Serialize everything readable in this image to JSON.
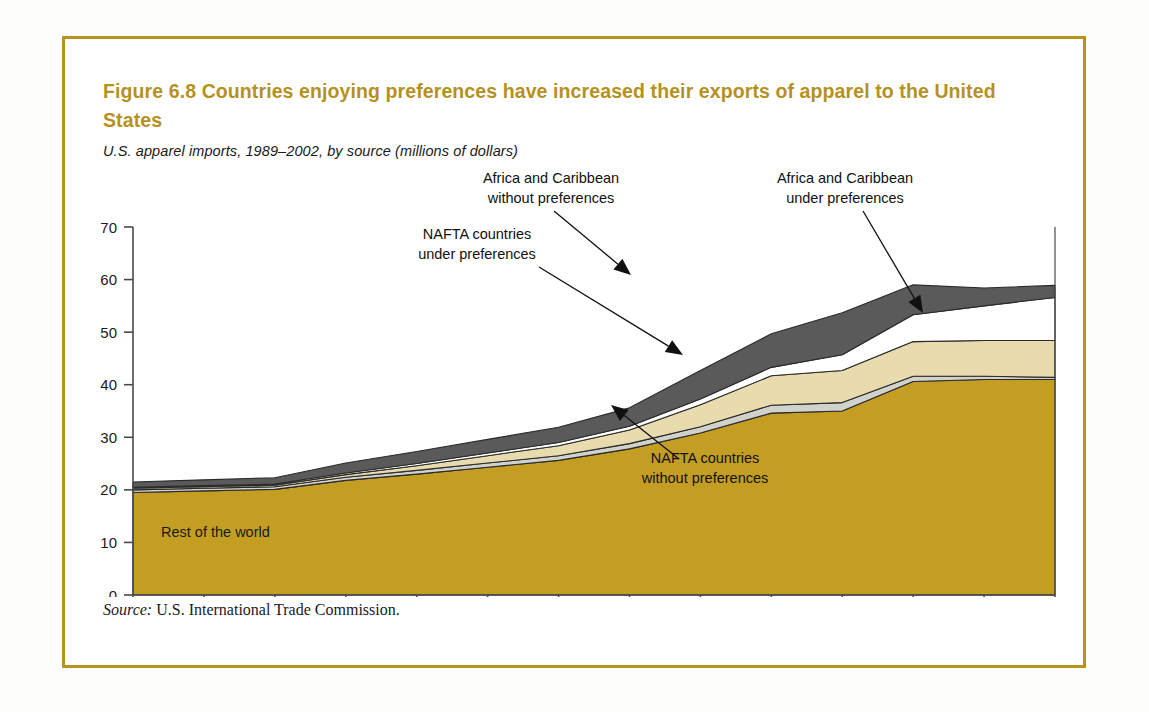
{
  "figure": {
    "title": "Figure 6.8  Countries enjoying preferences have increased their exports of apparel to the United States",
    "subtitle": "U.S. apparel imports, 1989–2002, by source (millions of dollars)",
    "source_label": "Source:",
    "source_text": " U.S. International Trade Commission.",
    "frame_color": "#b8941f",
    "title_color": "#b5911e"
  },
  "chart_data": {
    "type": "area",
    "stacked": true,
    "title": "Figure 6.8  Countries enjoying preferences have increased their exports of apparel to the United States",
    "subtitle": "U.S. apparel imports, 1989–2002, by source (millions of dollars)",
    "xlabel": "",
    "ylabel": "",
    "ylim": [
      0,
      70
    ],
    "ytick_step": 10,
    "yticks": [
      0,
      10,
      20,
      30,
      40,
      50,
      60,
      70
    ],
    "grid": false,
    "legend": "inline-annotations",
    "x": [
      1989,
      1990,
      1991,
      1992,
      1993,
      1994,
      1995,
      1996,
      1997,
      1998,
      1999,
      2000,
      2001,
      2002
    ],
    "categories": [
      "1989",
      "1990",
      "1991",
      "1992",
      "1993",
      "1994",
      "1995",
      "1996",
      "1997",
      "1998",
      "1999",
      "2000",
      "2001",
      "2002"
    ],
    "series": [
      {
        "name": "Rest of the world",
        "color": "#c39e23",
        "values": [
          19.5,
          19.8,
          20.1,
          21.8,
          23.0,
          24.3,
          25.6,
          27.8,
          30.8,
          34.6,
          35.0,
          40.6,
          41.0,
          41.0
        ]
      },
      {
        "name": "NAFTA countries without preferences",
        "color": "#d2d2cc",
        "values": [
          0.5,
          0.5,
          0.5,
          0.6,
          0.7,
          0.8,
          0.9,
          1.0,
          1.2,
          1.5,
          1.6,
          1.0,
          0.6,
          0.4
        ]
      },
      {
        "name": "NAFTA countries under preferences",
        "color": "#e8dbae",
        "values": [
          0.3,
          0.3,
          0.3,
          0.5,
          0.9,
          1.4,
          1.9,
          2.6,
          4.2,
          5.6,
          6.1,
          6.6,
          6.8,
          7.0
        ]
      },
      {
        "name": "Africa and Caribbean under preferences",
        "color": "#ffffff",
        "values": [
          0.2,
          0.2,
          0.2,
          0.3,
          0.4,
          0.5,
          0.6,
          0.7,
          1.1,
          1.6,
          3.0,
          5.1,
          6.6,
          8.2
        ]
      },
      {
        "name": "Africa and Caribbean without preferences",
        "color": "#5a5a5a",
        "values": [
          1.0,
          1.1,
          1.2,
          1.9,
          2.3,
          2.6,
          2.9,
          3.5,
          5.4,
          6.4,
          8.0,
          5.7,
          3.4,
          2.3
        ]
      }
    ],
    "totals": [
      21.5,
      21.9,
      22.3,
      25.1,
      27.3,
      29.6,
      31.9,
      35.6,
      42.7,
      49.7,
      53.7,
      59.0,
      58.4,
      58.9
    ],
    "annotations": [
      {
        "id": "africa-caribbean-without-preferences",
        "text_line1": "Africa and Caribbean",
        "text_line2": "without preferences",
        "text_x": 486,
        "text_y": 16,
        "anchor": "middle",
        "leader_x1": 489,
        "leader_y1": 44,
        "leader_x2": 566,
        "leader_y2": 108
      },
      {
        "id": "africa-caribbean-under-preferences",
        "text_line1": "Africa and Caribbean",
        "text_line2": "under preferences",
        "text_x": 780,
        "text_y": 16,
        "anchor": "middle",
        "leader_x1": 798,
        "leader_y1": 44,
        "leader_x2": 858,
        "leader_y2": 146
      },
      {
        "id": "nafta-countries-under-preferences",
        "text_line1": "NAFTA countries",
        "text_line2": "under preferences",
        "text_x": 412,
        "text_y": 72,
        "anchor": "middle",
        "leader_x1": 474,
        "leader_y1": 100,
        "leader_x2": 618,
        "leader_y2": 188
      },
      {
        "id": "nafta-countries-without-preferences",
        "text_line1": "NAFTA countries",
        "text_line2": "without preferences",
        "text_x": 640,
        "text_y": 296,
        "anchor": "middle",
        "leader_x1": 614,
        "leader_y1": 292,
        "leader_x2": 546,
        "leader_y2": 238
      }
    ],
    "inline_labels": [
      {
        "id": "rest-of-the-world",
        "text": "Rest of the world",
        "x": 96,
        "y": 370
      }
    ]
  }
}
